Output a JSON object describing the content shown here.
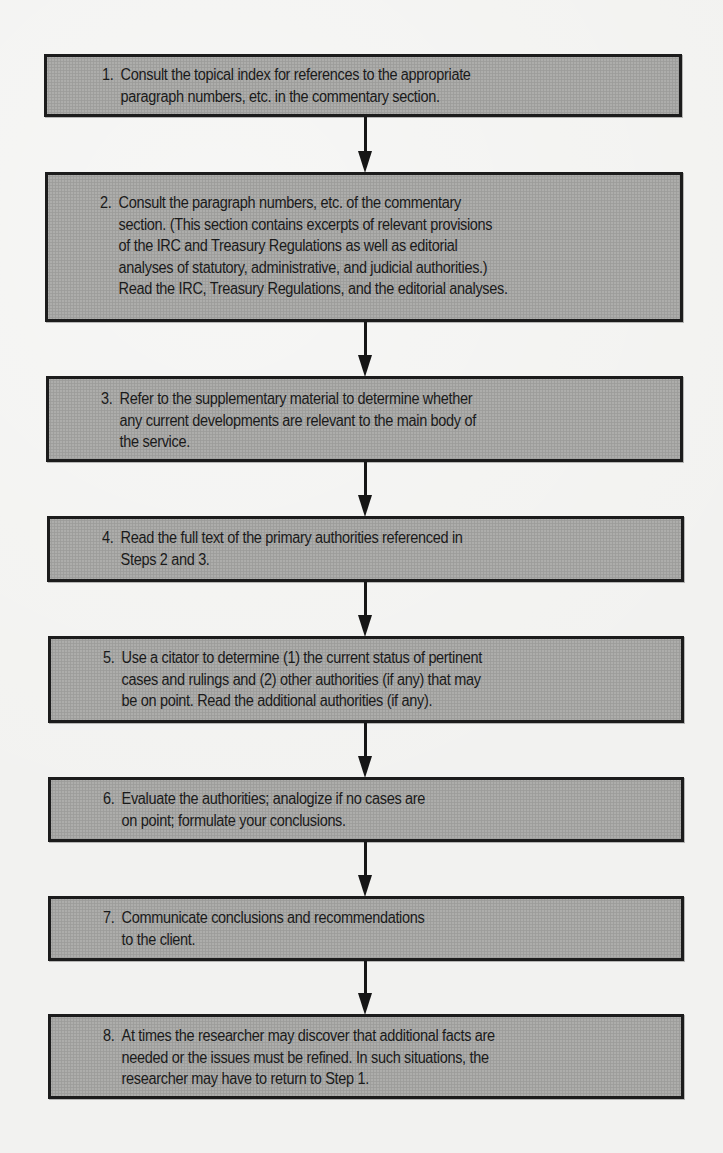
{
  "diagram": {
    "type": "flowchart",
    "direction": "top-to-bottom",
    "colors": {
      "box_fill": "#a8a8a6",
      "box_border": "#1c1c1c",
      "arrow": "#161616",
      "text": "#1a1a1a",
      "background": "#f2f2f0"
    },
    "steps": [
      {
        "number": "1.",
        "lines": [
          "Consult the topical index for references to the appropriate",
          "paragraph numbers, etc. in the commentary section."
        ]
      },
      {
        "number": "2.",
        "lines": [
          "Consult the paragraph numbers, etc. of the commentary",
          "section. (This section contains excerpts of relevant provisions",
          "of the IRC and Treasury Regulations as well as editorial",
          "analyses of statutory, administrative, and judicial authorities.)",
          "Read the IRC, Treasury Regulations, and the editorial analyses."
        ]
      },
      {
        "number": "3.",
        "lines": [
          "Refer to the supplementary material to determine whether",
          "any current developments are relevant to the main body of",
          "the service."
        ]
      },
      {
        "number": "4.",
        "lines": [
          "Read the full text of the primary authorities referenced in",
          "Steps 2 and 3."
        ]
      },
      {
        "number": "5.",
        "lines": [
          "Use a citator to determine (1) the current status of pertinent",
          "cases and rulings and (2) other authorities (if any) that may",
          "be on point. Read the additional authorities (if any)."
        ]
      },
      {
        "number": "6.",
        "lines": [
          "Evaluate the authorities; analogize if no cases are",
          "on point; formulate your conclusions."
        ]
      },
      {
        "number": "7.",
        "lines": [
          "Communicate conclusions and recommendations",
          "to the client."
        ]
      },
      {
        "number": "8.",
        "lines": [
          "At times the researcher may discover that additional facts are",
          "needed or the issues must be refined. In such situations, the",
          "researcher may have to return to Step 1."
        ]
      }
    ],
    "edges": [
      {
        "from": 1,
        "to": 2
      },
      {
        "from": 2,
        "to": 3
      },
      {
        "from": 3,
        "to": 4
      },
      {
        "from": 4,
        "to": 5
      },
      {
        "from": 5,
        "to": 6
      },
      {
        "from": 6,
        "to": 7
      },
      {
        "from": 7,
        "to": 8
      }
    ]
  }
}
